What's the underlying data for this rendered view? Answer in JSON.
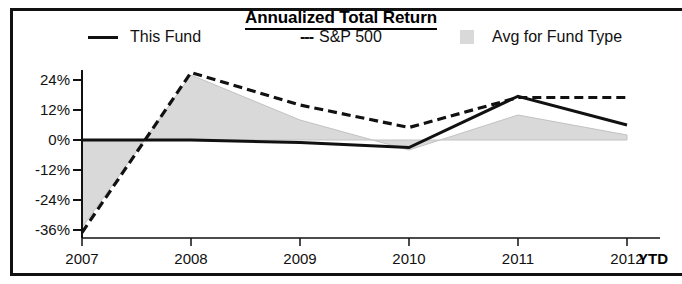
{
  "chart": {
    "title": "Annualized Total Return",
    "legend": [
      {
        "label": "This Fund",
        "marker": "solid-line",
        "color": "#111111"
      },
      {
        "label": "S&P 500",
        "marker": "dashed-line",
        "color": "#111111",
        "prefix": "---"
      },
      {
        "label": "Avg for Fund Type",
        "marker": "area-swatch",
        "color": "#d9d9d9"
      }
    ],
    "ytd_label": "YTD"
  },
  "chart_data": {
    "type": "line",
    "title": "Annualized Total Return",
    "xlabel": "",
    "ylabel": "",
    "categories": [
      "2007",
      "2008",
      "2009",
      "2010",
      "2011",
      "2012"
    ],
    "x_tick_labels": [
      "2007",
      "2008",
      "2009",
      "2010",
      "2011",
      "2012"
    ],
    "x_axis_note": "YTD",
    "y_tick_labels": [
      "24%",
      "12%",
      "0%",
      "-12%",
      "-24%",
      "-36%"
    ],
    "y_tick_values": [
      24,
      12,
      0,
      -12,
      -24,
      -36
    ],
    "ylim": [
      -40,
      30
    ],
    "grid": false,
    "legend_position": "top",
    "series": [
      {
        "name": "This Fund",
        "style": "solid",
        "color": "#111111",
        "values": [
          0,
          0,
          -1,
          -3,
          17.5,
          6
        ]
      },
      {
        "name": "S&P 500",
        "style": "dashed",
        "color": "#111111",
        "values": [
          -37,
          27,
          14,
          5,
          17,
          17
        ]
      },
      {
        "name": "Avg for Fund Type",
        "style": "filled-area",
        "color": "#d9d9d9",
        "values": [
          -35,
          26,
          8,
          -4,
          10,
          2
        ]
      }
    ]
  }
}
